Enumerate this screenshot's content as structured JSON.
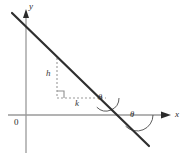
{
  "figure": {
    "background_color": "#ffffff",
    "axes": {
      "x_axis_label": "x",
      "y_axis_label": "y",
      "origin_label": "0",
      "axis_color": "#9a9a9a",
      "arrow_color": "#2b2b2b"
    },
    "line": {
      "name": "slanted-line",
      "color": "#2f2f2f",
      "stroke_width": 2.2,
      "start": [
        12,
        13
      ],
      "end": [
        149,
        146
      ],
      "description": "straight line of negative slope crossing the y-axis above origin and the x-axis to the right of origin"
    },
    "slope_triangle": {
      "color": "#9a9a9a",
      "dash_pattern": "2 2",
      "vertical_leg_label": "h",
      "horizontal_leg_label": "k",
      "vertical_leg": {
        "x": 57,
        "y_top": 58,
        "y_bottom": 98
      },
      "horizontal_leg": {
        "y": 98,
        "x_left": 57,
        "x_right": 106
      },
      "right_angle_marker": {
        "x": 57,
        "y": 98,
        "size": 7
      }
    },
    "angles": [
      {
        "name": "angle-at-triangle",
        "label": "θ",
        "vertex": [
          106,
          98
        ],
        "arc_radius": 13,
        "color": "#4a4a4a"
      },
      {
        "name": "angle-at-x-axis",
        "label": "θ",
        "vertex": [
          137,
          115
        ],
        "arc_radius": 16,
        "color": "#4a4a4a"
      }
    ]
  }
}
